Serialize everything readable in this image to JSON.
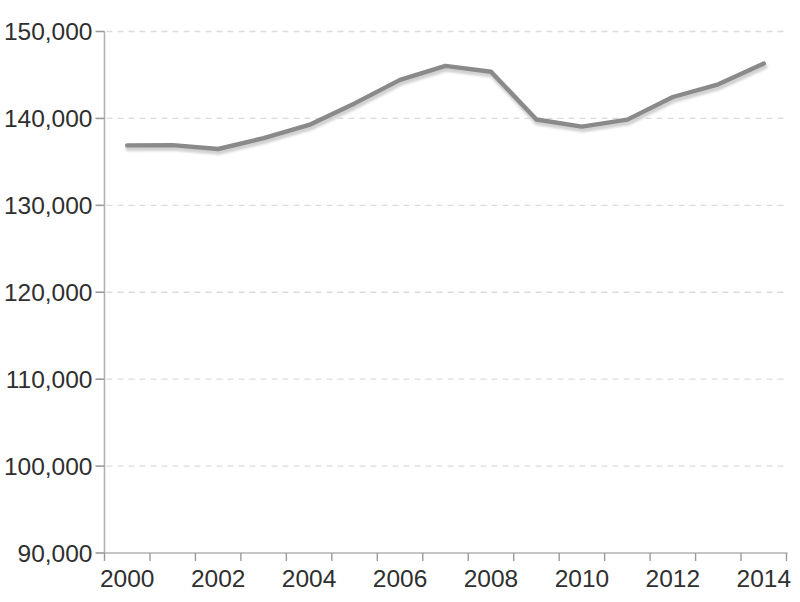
{
  "chart_data": {
    "type": "line",
    "title": "",
    "xlabel": "",
    "ylabel": "",
    "x": [
      2000,
      2001,
      2002,
      2003,
      2004,
      2005,
      2006,
      2007,
      2008,
      2009,
      2010,
      2011,
      2012,
      2013,
      2014
    ],
    "values": [
      136891,
      136933,
      136485,
      137736,
      139252,
      141730,
      144427,
      146047,
      145362,
      139877,
      139064,
      139869,
      142469,
      143929,
      146305
    ],
    "ylim": [
      90000,
      150000
    ],
    "y_ticks": [
      90000,
      100000,
      110000,
      120000,
      130000,
      140000,
      150000
    ],
    "y_tick_labels": [
      "90,000",
      "100,000",
      "110,000",
      "120,000",
      "130,000",
      "140,000",
      "150,000"
    ],
    "x_tick_years": [
      2000,
      2002,
      2004,
      2006,
      2008,
      2010,
      2012,
      2014
    ],
    "x_tick_labels": [
      "2000",
      "2002",
      "2004",
      "2006",
      "2008",
      "2010",
      "2012",
      "2014"
    ],
    "grid": "horizontal-dotted",
    "legend": "none",
    "colors": {
      "line": "#8a8a8a",
      "line_shadow": "#c9c9c9",
      "axis": "#b3b3b3",
      "tick": "#9a9a9a",
      "grid": "#dcdcdc",
      "text": "#2f2f2f",
      "background": "#ffffff"
    }
  }
}
